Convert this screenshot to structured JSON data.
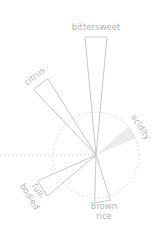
{
  "chart_data": {
    "type": "radial-bar",
    "title": "",
    "center": [
      96,
      155
    ],
    "reference_circle_radius": 43,
    "reference_line": "dotted horizontal from center to left edge",
    "grid": false,
    "legend": null,
    "categories": [
      "bittersweet",
      "acidity",
      "brown rice",
      "full-bodied",
      "citrus"
    ],
    "series": [
      {
        "name": "flavor profile",
        "values": [
          2.75,
          1.0,
          1.1,
          1.45,
          2.1
        ],
        "angles_deg": [
          0,
          58,
          172,
          238,
          322
        ],
        "highlighted": [
          "acidity"
        ]
      }
    ],
    "bars": [
      {
        "label": "bittersweet",
        "label_lines": [
          "bittersweet"
        ],
        "angle": 0,
        "length": 118,
        "width": 22,
        "filled": false
      },
      {
        "label": "acidity",
        "label_lines": [
          "acidity"
        ],
        "angle": 58,
        "length": 43,
        "width": 14,
        "filled": true
      },
      {
        "label": "brown rice",
        "label_lines": [
          "brown",
          "rice"
        ],
        "angle": 172,
        "length": 47,
        "width": 16,
        "filled": false
      },
      {
        "label": "full-bodied",
        "label_lines": [
          "full-",
          "bodied"
        ],
        "angle": 238,
        "length": 63,
        "width": 18,
        "filled": false
      },
      {
        "label": "citrus",
        "label_lines": [
          "citrus"
        ],
        "angle": 322,
        "length": 90,
        "width": 18,
        "filled": false
      }
    ],
    "colors": {
      "stroke": "#c8c8c8",
      "fill_highlight": "#ececec",
      "label": "#b4b4b4",
      "reference": "#d2d2d2"
    }
  }
}
